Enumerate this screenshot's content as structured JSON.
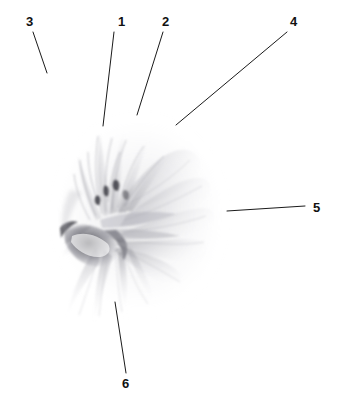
{
  "figure": {
    "kind": "botanical-line-drawing",
    "medium": "graphite-pencil-illustration",
    "background_color": "#ffffff",
    "ink_color": "#1a1a1a",
    "graphite_color": "#8a8a90",
    "width": 339,
    "height": 410
  },
  "callouts": [
    {
      "id": "callout-1",
      "label": "1",
      "label_x": 118,
      "label_y": 15,
      "line_x1": 114,
      "line_y1": 32,
      "line_x2": 103,
      "line_y2": 126
    },
    {
      "id": "callout-2",
      "label": "2",
      "label_x": 162,
      "label_y": 15,
      "line_x1": 163,
      "line_y1": 32,
      "line_x2": 137,
      "line_y2": 115
    },
    {
      "id": "callout-3",
      "label": "3",
      "label_x": 26,
      "label_y": 15,
      "line_x1": 33,
      "line_y1": 32,
      "line_x2": 47,
      "line_y2": 73
    },
    {
      "id": "callout-4",
      "label": "4",
      "label_x": 290,
      "label_y": 15,
      "line_x1": 287,
      "line_y1": 32,
      "line_x2": 176,
      "line_y2": 125
    },
    {
      "id": "callout-5",
      "label": "5",
      "label_x": 313,
      "label_y": 201,
      "line_x1": 305,
      "line_y1": 206,
      "line_x2": 227,
      "line_y2": 211
    },
    {
      "id": "callout-6",
      "label": "6",
      "label_x": 122,
      "label_y": 377,
      "line_x1": 126,
      "line_y1": 373,
      "line_x2": 115,
      "line_y2": 302
    }
  ]
}
